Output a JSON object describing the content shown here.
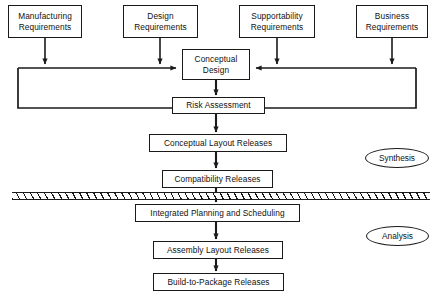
{
  "diagram": {
    "stroke_color": "#1a1a1a",
    "background_color": "#ffffff",
    "inputs": [
      {
        "id": "manufacturing",
        "line1": "Manufacturing",
        "line2": "Requirements"
      },
      {
        "id": "design",
        "line1": "Design",
        "line2": "Requirements"
      },
      {
        "id": "supportability",
        "line1": "Supportability",
        "line2": "Requirements"
      },
      {
        "id": "business",
        "line1": "Business",
        "line2": "Requirements"
      }
    ],
    "nodes": {
      "conceptual_design": {
        "line1": "Conceptual",
        "line2": "Design"
      },
      "risk_assessment": {
        "line1": "Risk Assessment"
      },
      "conceptual_layout_releases": {
        "line1": "Conceptual Layout Releases"
      },
      "compatibility_releases": {
        "line1": "Compatibility Releases"
      },
      "integrated_planning": {
        "line1": "Integrated Planning and Scheduling"
      },
      "assembly_layout_releases": {
        "line1": "Assembly Layout Releases"
      },
      "build_to_package_releases": {
        "line1": "Build-to-Package Releases"
      }
    },
    "phases": {
      "synthesis": "Synthesis",
      "analysis": "Analysis"
    }
  }
}
